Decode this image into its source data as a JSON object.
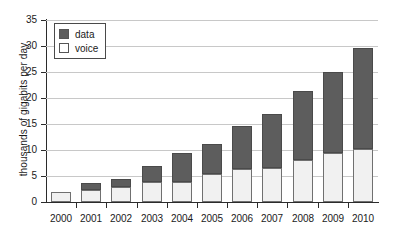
{
  "chart_data": {
    "type": "bar",
    "title": "",
    "subtitle": "",
    "xlabel": "",
    "ylabel": "thousands of gigabits per day",
    "categories": [
      "2000",
      "2001",
      "2002",
      "2003",
      "2004",
      "2005",
      "2006",
      "2007",
      "2008",
      "2009",
      "2010"
    ],
    "series": [
      {
        "name": "voice",
        "color": "#f1f1f1",
        "values": [
          2.0,
          2.3,
          2.8,
          3.9,
          3.9,
          5.3,
          6.4,
          6.6,
          8.0,
          9.5,
          10.1
        ]
      },
      {
        "name": "data",
        "color": "#5d5d5d",
        "values": [
          0.0,
          1.3,
          1.5,
          3.0,
          5.6,
          5.7,
          8.2,
          10.3,
          13.2,
          15.5,
          19.5
        ]
      }
    ],
    "totals": [
      2.0,
      3.6,
      4.3,
      6.9,
      9.5,
      11.0,
      14.6,
      16.9,
      21.2,
      25.0,
      29.6
    ],
    "stacked": true,
    "ylim": [
      0,
      35
    ],
    "ytick_values": [
      0,
      5,
      10,
      15,
      20,
      25,
      30,
      35
    ],
    "ytick_labels": [
      "0",
      "5",
      "10",
      "15",
      "20",
      "25",
      "30",
      "35"
    ],
    "grid": true,
    "grid_axis": "y",
    "legend_position": "upper left",
    "legend_entries": [
      {
        "label": "data",
        "swatch": "data"
      },
      {
        "label": "voice",
        "swatch": "voice"
      }
    ]
  }
}
